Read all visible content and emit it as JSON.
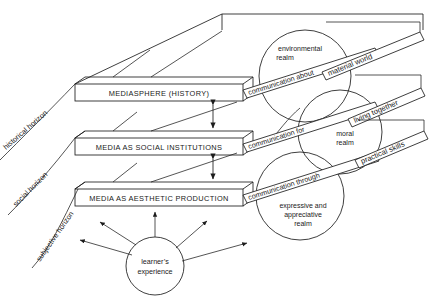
{
  "diagram": {
    "levels": [
      {
        "id": "mediasphere",
        "label": "MEDIASPHERE (HISTORY)"
      },
      {
        "id": "institutions",
        "label": "MEDIA AS SOCIAL INSTITUTIONS"
      },
      {
        "id": "aesthetic",
        "label": "MEDIA AS AESTHETIC PRODUCTION"
      }
    ],
    "horizons": [
      {
        "id": "historical",
        "label": "historical horizon"
      },
      {
        "id": "social",
        "label": "social horizon"
      },
      {
        "id": "subjective",
        "label": "subjective horizon"
      }
    ],
    "communication_bars": [
      {
        "id": "about",
        "label": "communication about"
      },
      {
        "id": "for",
        "label": "communication for"
      },
      {
        "id": "through",
        "label": "communication through"
      }
    ],
    "realms": [
      {
        "id": "environmental",
        "line1": "environmental",
        "line2": "realm"
      },
      {
        "id": "moral",
        "line1": "moral",
        "line2": "realm"
      },
      {
        "id": "expressive",
        "line1": "expressive and",
        "line2": "appreciative",
        "line3": "realm"
      }
    ],
    "outcome_bars": [
      {
        "id": "material-world",
        "label": "material world"
      },
      {
        "id": "living-together",
        "label": "living together"
      },
      {
        "id": "practical-skills",
        "label": "practical skills"
      }
    ],
    "learner": {
      "line1": "learner’s",
      "line2": "experience"
    },
    "colors": {
      "stroke": "#1c1c1c",
      "fill": "#ffffff",
      "background": "#ffffff"
    }
  }
}
